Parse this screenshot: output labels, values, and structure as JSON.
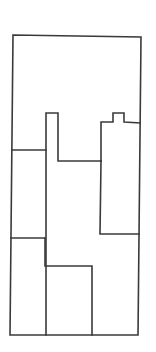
{
  "diagram": {
    "type": "floor-plan-outline",
    "stroke_color": "#3a3a3a",
    "background": "#ffffff",
    "outer_boundary": [
      [
        13,
        35
      ],
      [
        141,
        37
      ],
      [
        138,
        335
      ],
      [
        10,
        335
      ]
    ],
    "walls": [
      {
        "id": "left-upper-divider",
        "points": [
          [
            12,
            150
          ],
          [
            46,
            150
          ]
        ]
      },
      {
        "id": "left-column-bump",
        "points": [
          [
            46,
            335
          ],
          [
            46,
            113
          ],
          [
            58,
            113
          ],
          [
            58,
            161
          ],
          [
            101,
            161
          ]
        ]
      },
      {
        "id": "right-block",
        "points": [
          [
            101,
            161
          ],
          [
            101,
            122
          ],
          [
            113,
            122
          ],
          [
            113,
            113
          ],
          [
            124,
            113
          ],
          [
            124,
            122
          ],
          [
            140,
            123
          ]
        ]
      },
      {
        "id": "right-block-left-wall",
        "points": [
          [
            101,
            161
          ],
          [
            100,
            234
          ],
          [
            139,
            234
          ]
        ]
      },
      {
        "id": "lower-left-divider",
        "points": [
          [
            11,
            238
          ],
          [
            45,
            238
          ]
        ]
      },
      {
        "id": "lower-step",
        "points": [
          [
            45,
            238
          ],
          [
            45,
            266
          ],
          [
            92,
            266
          ],
          [
            92,
            335
          ]
        ]
      }
    ]
  }
}
